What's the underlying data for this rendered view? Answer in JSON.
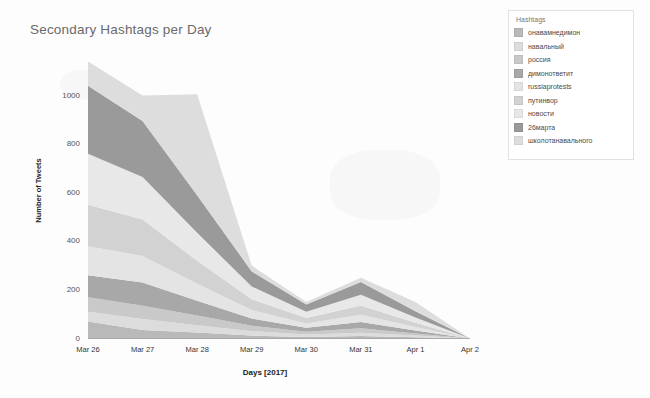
{
  "chart_data": {
    "type": "area",
    "stacked": true,
    "title": "Secondary Hashtags per Day",
    "xlabel": "Days [2017]",
    "ylabel": "Number of Tweets",
    "categories": [
      "Mar 26",
      "Mar 27",
      "Mar 28",
      "Mar 29",
      "Mar 30",
      "Mar 31",
      "Apr 1",
      "Apr 2"
    ],
    "ylim": [
      0,
      1150
    ],
    "yticks": [
      0,
      200,
      400,
      600,
      800,
      1000
    ],
    "grid": false,
    "legend_title": "Hashtags",
    "legend_position": "right",
    "series": [
      {
        "name": "онавамнедимон",
        "color": "#b9b9b9",
        "values": [
          70,
          35,
          25,
          12,
          6,
          10,
          5,
          0
        ]
      },
      {
        "name": "навальный",
        "color": "#dcdcdc",
        "values": [
          40,
          45,
          30,
          18,
          10,
          14,
          7,
          0
        ]
      },
      {
        "name": "россия",
        "color": "#c9c9c9",
        "values": [
          60,
          55,
          40,
          22,
          12,
          18,
          9,
          0
        ]
      },
      {
        "name": "димонответит",
        "color": "#a8a8a8",
        "values": [
          90,
          95,
          60,
          30,
          16,
          26,
          12,
          0
        ]
      },
      {
        "name": "russiaprotests",
        "color": "#e4e4e4",
        "values": [
          120,
          110,
          70,
          35,
          18,
          30,
          14,
          0
        ]
      },
      {
        "name": "путинвор",
        "color": "#d2d2d2",
        "values": [
          170,
          150,
          95,
          45,
          22,
          38,
          18,
          0
        ]
      },
      {
        "name": "новости",
        "color": "#e8e8e8",
        "values": [
          210,
          175,
          115,
          52,
          26,
          44,
          21,
          0
        ]
      },
      {
        "name": "26марта",
        "color": "#9a9a9a",
        "values": [
          280,
          230,
          155,
          62,
          30,
          52,
          26,
          0
        ]
      },
      {
        "name": "школотанавального",
        "color": "#dddddd",
        "values": [
          100,
          105,
          415,
          24,
          10,
          18,
          38,
          0
        ]
      }
    ]
  },
  "axis": {
    "x_tick_labels": [
      "Mar 26",
      "Mar 27",
      "Mar 28",
      "Mar 29",
      "Mar 30",
      "Mar 31",
      "Apr 1",
      "Apr 2"
    ],
    "y_tick_labels": [
      "1000",
      "800",
      "600",
      "400",
      "200",
      "0"
    ]
  }
}
